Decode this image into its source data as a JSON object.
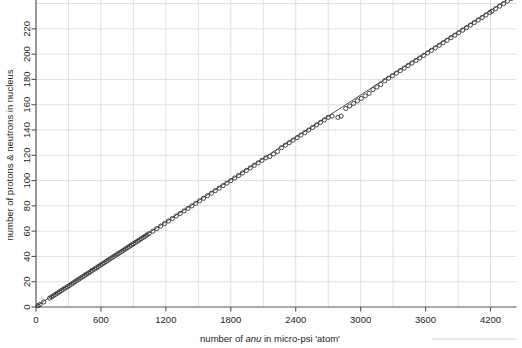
{
  "figure": {
    "background": "#ffffff",
    "ink_color": "#2b2b2b",
    "grid_color": "#d8d8d8",
    "axis_color": "#555555"
  },
  "chart_data": {
    "type": "scatter",
    "title": "",
    "xlabel_parts": {
      "before": "number of ",
      "italic": "anu",
      "after": " in micro-psi 'atom'"
    },
    "xlabel": "number of anu in micro-psi 'atom'",
    "ylabel": "number of protons & neutrons in nucleus",
    "xlim": [
      0,
      4440
    ],
    "ylim": [
      0,
      246
    ],
    "xticks": [
      0,
      600,
      1200,
      1800,
      2400,
      3000,
      3600,
      4200
    ],
    "xticklabels": [
      "0",
      "600",
      "1200",
      "1800",
      "2400",
      "3000",
      "3600",
      "4200"
    ],
    "yticks": [
      0,
      20,
      40,
      60,
      80,
      100,
      120,
      140,
      160,
      180,
      200,
      220
    ],
    "yticklabels": [
      "0",
      "20",
      "40",
      "60",
      "80",
      "100",
      "120",
      "140",
      "160",
      "180",
      "200",
      "220"
    ],
    "x_minor_step": 300,
    "y_minor_step": 20,
    "grid": true,
    "grid_minor_vertical": true,
    "legend": "none",
    "marker": "open-circle",
    "marker_size_px": 4.2,
    "fit_line": {
      "visible": true,
      "slope": 0.0557,
      "intercept": 0.6,
      "x_from": 0,
      "x_to": 4440
    },
    "series": [
      {
        "name": "elements",
        "points": [
          [
            18,
            1
          ],
          [
            36,
            2
          ],
          [
            72,
            4
          ],
          [
            126,
            7
          ],
          [
            144,
            8
          ],
          [
            162,
            9
          ],
          [
            180,
            10
          ],
          [
            198,
            11
          ],
          [
            216,
            12
          ],
          [
            234,
            13
          ],
          [
            252,
            14
          ],
          [
            270,
            15
          ],
          [
            290,
            16
          ],
          [
            308,
            17
          ],
          [
            326,
            18
          ],
          [
            344,
            19
          ],
          [
            360,
            20
          ],
          [
            378,
            21
          ],
          [
            396,
            22
          ],
          [
            414,
            23
          ],
          [
            432,
            24
          ],
          [
            450,
            25
          ],
          [
            468,
            26
          ],
          [
            486,
            27
          ],
          [
            504,
            28
          ],
          [
            520,
            29
          ],
          [
            540,
            30
          ],
          [
            558,
            31
          ],
          [
            576,
            32
          ],
          [
            594,
            33
          ],
          [
            612,
            34
          ],
          [
            630,
            35
          ],
          [
            648,
            36
          ],
          [
            666,
            37
          ],
          [
            684,
            38
          ],
          [
            702,
            39
          ],
          [
            720,
            40
          ],
          [
            738,
            41
          ],
          [
            756,
            42
          ],
          [
            774,
            43
          ],
          [
            792,
            44
          ],
          [
            810,
            45
          ],
          [
            828,
            46
          ],
          [
            846,
            47
          ],
          [
            864,
            48
          ],
          [
            882,
            49
          ],
          [
            900,
            50
          ],
          [
            918,
            51
          ],
          [
            936,
            52
          ],
          [
            954,
            53
          ],
          [
            972,
            54
          ],
          [
            990,
            55
          ],
          [
            1008,
            56
          ],
          [
            1026,
            57
          ],
          [
            1044,
            58
          ],
          [
            1080,
            60
          ],
          [
            1116,
            62
          ],
          [
            1152,
            64
          ],
          [
            1188,
            66
          ],
          [
            1224,
            68
          ],
          [
            1260,
            70
          ],
          [
            1296,
            72
          ],
          [
            1332,
            74
          ],
          [
            1368,
            76
          ],
          [
            1404,
            78
          ],
          [
            1440,
            80
          ],
          [
            1476,
            82
          ],
          [
            1512,
            84
          ],
          [
            1548,
            86
          ],
          [
            1584,
            88
          ],
          [
            1620,
            90
          ],
          [
            1656,
            92
          ],
          [
            1692,
            94
          ],
          [
            1728,
            96
          ],
          [
            1764,
            98
          ],
          [
            1800,
            100
          ],
          [
            1836,
            102
          ],
          [
            1872,
            104
          ],
          [
            1908,
            106
          ],
          [
            1944,
            108
          ],
          [
            1980,
            110
          ],
          [
            2016,
            112
          ],
          [
            2052,
            114
          ],
          [
            2088,
            116
          ],
          [
            2124,
            118
          ],
          [
            2160,
            119
          ],
          [
            2196,
            121
          ],
          [
            2232,
            123
          ],
          [
            2268,
            126
          ],
          [
            2304,
            128
          ],
          [
            2340,
            130
          ],
          [
            2376,
            132
          ],
          [
            2412,
            134
          ],
          [
            2448,
            136
          ],
          [
            2484,
            138
          ],
          [
            2520,
            140
          ],
          [
            2556,
            142
          ],
          [
            2592,
            144
          ],
          [
            2628,
            146
          ],
          [
            2664,
            148
          ],
          [
            2700,
            150
          ],
          [
            2736,
            151
          ],
          [
            2790,
            150
          ],
          [
            2820,
            151
          ],
          [
            2862,
            157
          ],
          [
            2898,
            159
          ],
          [
            2934,
            161
          ],
          [
            2970,
            163
          ],
          [
            3006,
            165
          ],
          [
            3042,
            167
          ],
          [
            3078,
            169
          ],
          [
            3114,
            172
          ],
          [
            3150,
            174
          ],
          [
            3186,
            176
          ],
          [
            3222,
            179
          ],
          [
            3258,
            181
          ],
          [
            3294,
            183
          ],
          [
            3330,
            185
          ],
          [
            3366,
            187
          ],
          [
            3402,
            189
          ],
          [
            3438,
            191
          ],
          [
            3474,
            193
          ],
          [
            3510,
            195
          ],
          [
            3546,
            197
          ],
          [
            3582,
            199
          ],
          [
            3618,
            201
          ],
          [
            3654,
            203
          ],
          [
            3690,
            205
          ],
          [
            3726,
            207
          ],
          [
            3762,
            209
          ],
          [
            3798,
            211
          ],
          [
            3834,
            213
          ],
          [
            3870,
            215
          ],
          [
            3906,
            217
          ],
          [
            3942,
            219
          ],
          [
            3978,
            221
          ],
          [
            4014,
            223
          ],
          [
            4050,
            225
          ],
          [
            4086,
            227
          ],
          [
            4122,
            229
          ],
          [
            4158,
            231
          ],
          [
            4194,
            233
          ],
          [
            4212,
            234
          ],
          [
            4248,
            236
          ],
          [
            4284,
            238
          ],
          [
            4320,
            240
          ],
          [
            4356,
            242
          ],
          [
            4392,
            244
          ],
          [
            4410,
            245
          ]
        ]
      }
    ]
  }
}
